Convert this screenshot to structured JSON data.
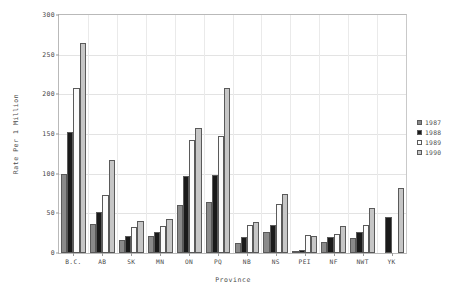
{
  "chart_data": {
    "type": "bar",
    "title": "",
    "xlabel": "Province",
    "ylabel": "Rate Per 1 Million",
    "ylim": [
      0,
      300
    ],
    "yticks": [
      0,
      50,
      100,
      150,
      200,
      250,
      300
    ],
    "grid": true,
    "legend_position": "right",
    "categories": [
      "B.C.",
      "AB",
      "SK",
      "MN",
      "ON",
      "PQ",
      "NB",
      "NS",
      "PEI",
      "NF",
      "NWT",
      "YK"
    ],
    "series": [
      {
        "name": "1987",
        "color": "#8a8a8a",
        "values": [
          99,
          36,
          16,
          22,
          61,
          64,
          13,
          26,
          3,
          14,
          19,
          0
        ]
      },
      {
        "name": "1988",
        "color": "#1a1a1a",
        "values": [
          152,
          52,
          22,
          26,
          97,
          98,
          20,
          35,
          4,
          20,
          26,
          45
        ]
      },
      {
        "name": "1989",
        "color": "#fbfbfb",
        "values": [
          208,
          73,
          33,
          34,
          142,
          147,
          35,
          62,
          23,
          24,
          35,
          0
        ]
      },
      {
        "name": "1990",
        "color": "#c6c6c6",
        "values": [
          265,
          117,
          40,
          43,
          158,
          208,
          39,
          75,
          22,
          34,
          57,
          82
        ]
      }
    ]
  },
  "legend": {
    "items": [
      {
        "label": "1987"
      },
      {
        "label": "1988"
      },
      {
        "label": "1989"
      },
      {
        "label": "1990"
      }
    ]
  }
}
